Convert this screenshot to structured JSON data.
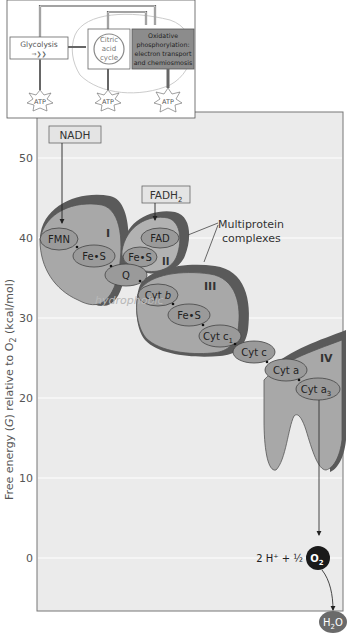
{
  "inset": {
    "glycolysis": "Glycolysis",
    "citric": [
      "Citric",
      "acid",
      "cycle"
    ],
    "oxphos": [
      "Oxidative",
      "phosphorylation:",
      "electron transport",
      "and chemiosmosis"
    ],
    "atp": [
      "ATP",
      "ATP",
      "ATP"
    ]
  },
  "chart": {
    "ylabel": "Free energy (G) relative to O2 (kcal/mol)",
    "ylabel_main": "Free energy (",
    "ylabel_g": "G",
    "ylabel_mid": ") relative to O",
    "ylabel_sub": "2",
    "ylabel_end": " (kcal/mol)",
    "ticks": [
      "50",
      "40",
      "30",
      "20",
      "10",
      "0"
    ]
  },
  "inputs": {
    "nadh": "NADH",
    "fadh": "FADH",
    "fadh_sub": "2"
  },
  "complexes": {
    "I": "I",
    "II": "II",
    "III": "III",
    "IV": "IV",
    "callout_1": "Multiprotein",
    "callout_2": "complexes"
  },
  "carriers": {
    "fmn": "FMN",
    "fes1": "Fe•S",
    "fad": "FAD",
    "fes2": "Fe•S",
    "q": "Q",
    "cytb": "Cyt b",
    "fes3": "Fe•S",
    "cytc1": "Cyt c",
    "cytc1_sub": "1",
    "cytc": "Cyt c",
    "cyta": "Cyt a",
    "cyta3": "Cyt a",
    "cyta3_sub": "3"
  },
  "annotation": "hydrophobic",
  "products": {
    "equation": "2 H⁺ + ½",
    "o2": "O",
    "o2_sub": "2",
    "h2o_h": "H",
    "h2o_sub": "2",
    "h2o_o": "O"
  },
  "colors": {
    "complex_fill": "#a8a8a8",
    "complex_dark": "#5a5a5a",
    "carrier_fill": "#9a9a9a",
    "chart_bg": "#ebebeb",
    "oxphos_box": "#8c8c8c",
    "o2_fill": "#1a1a1a",
    "h2o_fill": "#6a6a6a"
  }
}
